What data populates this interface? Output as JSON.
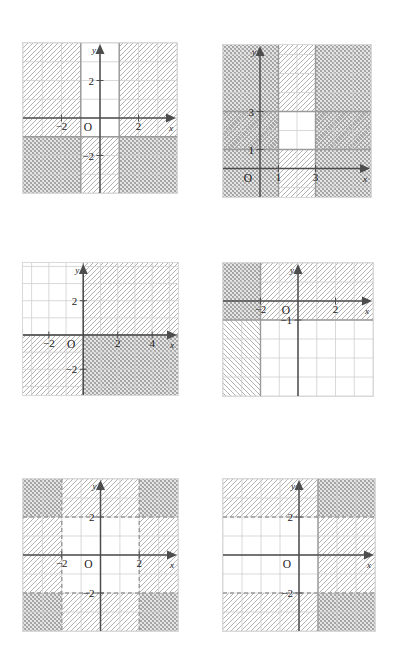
{
  "page": {
    "kind": "math-worksheet-answer-key",
    "background": "#ffffff",
    "columns": 2,
    "rows": 3
  },
  "style": {
    "grid_minor_color": "#cfcfcf",
    "grid_major_color": "#9a9a9a",
    "axis_color": "#4d4d4d",
    "hatch_a_color": "#a8a8a8",
    "hatch_b_color": "#9c9c9c",
    "plot_border_color": "#d9d9d9",
    "label_color": "#333333",
    "number_color": "#1b1b1b"
  },
  "axis_labels": {
    "x": "x",
    "y": "y",
    "origin": "O"
  },
  "problems": [
    {
      "number": "12",
      "underlined": false,
      "position": {
        "x": 24,
        "y": 18
      },
      "plot": {
        "x": 22,
        "y": 42,
        "w": 154,
        "h": 150
      },
      "view": {
        "xmin": -4,
        "xmax": 4,
        "ymin": -4,
        "ymax": 4
      },
      "axis_ticks": {
        "x": [
          -2,
          2
        ],
        "y": [
          2,
          -2
        ]
      },
      "boundaries": [
        {
          "type": "vertical",
          "value": -1,
          "style": "solid"
        },
        {
          "type": "vertical",
          "value": 1,
          "style": "solid"
        },
        {
          "type": "horizontal",
          "value": -1,
          "style": "solid"
        }
      ],
      "regions": [
        {
          "label": "x <= -1",
          "hatch": "forward",
          "rect": [
            -4,
            -1,
            -1,
            4
          ]
        },
        {
          "label": "x >= 1",
          "hatch": "forward",
          "rect": [
            1,
            -1,
            4,
            4
          ]
        },
        {
          "label": "y <= -1 left",
          "hatch": "cross",
          "rect": [
            -4,
            -4,
            -1,
            -1
          ]
        },
        {
          "label": "y <= -1 middle",
          "hatch": "forward",
          "rect": [
            -1,
            -4,
            1,
            -1
          ]
        },
        {
          "label": "y <= -1 right",
          "hatch": "cross",
          "rect": [
            1,
            -4,
            4,
            -1
          ]
        }
      ],
      "solution_white": [
        [
          -1,
          -1,
          1,
          4
        ]
      ]
    },
    {
      "number": "15",
      "underlined": true,
      "position": {
        "x": 221,
        "y": 18
      },
      "plot": {
        "x": 222,
        "y": 44,
        "w": 148,
        "h": 152
      },
      "view": {
        "xmin": -2,
        "xmax": 6,
        "ymin": -1.5,
        "ymax": 6.5
      },
      "axis_ticks": {
        "x": [
          1,
          3
        ],
        "y": [
          1,
          3
        ]
      },
      "boundaries": [
        {
          "type": "vertical",
          "value": 1,
          "style": "solid"
        },
        {
          "type": "vertical",
          "value": 3,
          "style": "solid"
        },
        {
          "type": "horizontal",
          "value": 1,
          "style": "solid"
        },
        {
          "type": "horizontal",
          "value": 3,
          "style": "solid"
        }
      ],
      "regions": [
        {
          "label": "outside x band",
          "hatch": "cross",
          "rect": [
            -2,
            -1.5,
            1,
            6.5
          ]
        },
        {
          "label": "outside x band right",
          "hatch": "cross",
          "rect": [
            3,
            -1.5,
            6,
            6.5
          ]
        },
        {
          "label": "inside x band below",
          "hatch": "forward",
          "rect": [
            1,
            -1.5,
            3,
            1
          ]
        },
        {
          "label": "inside x band above",
          "hatch": "forward",
          "rect": [
            1,
            3,
            3,
            6.5
          ]
        },
        {
          "label": "y band left",
          "hatch": "forward",
          "rect": [
            -2,
            1,
            1,
            3
          ]
        },
        {
          "label": "y band right",
          "hatch": "forward",
          "rect": [
            3,
            1,
            6,
            3
          ]
        }
      ],
      "solution_white": [
        [
          1,
          1,
          3,
          3
        ]
      ]
    },
    {
      "number": "13",
      "underlined": false,
      "position": {
        "x": 24,
        "y": 238
      },
      "plot": {
        "x": 22,
        "y": 262,
        "w": 155,
        "h": 132
      },
      "view": {
        "xmin": -3.5,
        "xmax": 5.5,
        "ymin": -3.5,
        "ymax": 4.2
      },
      "axis_ticks": {
        "x": [
          -2,
          2,
          4
        ],
        "y": [
          2,
          -2
        ]
      },
      "boundaries": [
        {
          "type": "vertical",
          "value": 0,
          "style": "solid"
        },
        {
          "type": "horizontal",
          "value": 0,
          "style": "solid"
        }
      ],
      "regions": [
        {
          "label": "quadrant I",
          "hatch": "forward",
          "rect": [
            0,
            0,
            5.5,
            4.2
          ]
        },
        {
          "label": "quadrant III",
          "hatch": "forward",
          "rect": [
            -3.5,
            -3.5,
            0,
            0
          ]
        },
        {
          "label": "quadrant IV",
          "hatch": "cross",
          "rect": [
            0,
            -3.5,
            5.5,
            0
          ]
        }
      ],
      "solution_white": [
        [
          -3.5,
          0,
          0,
          4.2
        ]
      ]
    },
    {
      "number": "16",
      "underlined": true,
      "position": {
        "x": 221,
        "y": 238
      },
      "plot": {
        "x": 222,
        "y": 262,
        "w": 150,
        "h": 133
      },
      "view": {
        "xmin": -4,
        "xmax": 4,
        "ymin": -5,
        "ymax": 2
      },
      "axis_ticks": {
        "x": [
          -2,
          2
        ],
        "y": [
          -1
        ]
      },
      "boundaries": [
        {
          "type": "vertical",
          "value": -2,
          "style": "solid"
        },
        {
          "type": "horizontal",
          "value": -1,
          "style": "solid"
        }
      ],
      "regions": [
        {
          "label": "x <= -2 and y >= -1",
          "hatch": "cross",
          "rect": [
            -4,
            -1,
            -2,
            2
          ]
        },
        {
          "label": "x <= -2 and y <= -1",
          "hatch": "backward",
          "rect": [
            -4,
            -5,
            -2,
            -1
          ]
        },
        {
          "label": "y >= -1 right of -2",
          "hatch": "forward",
          "rect": [
            -2,
            -1,
            4,
            2
          ]
        }
      ],
      "solution_white": [
        [
          -2,
          -5,
          4,
          -1
        ]
      ]
    },
    {
      "number": "14",
      "underlined": false,
      "position": {
        "x": 24,
        "y": 452
      },
      "plot": {
        "x": 22,
        "y": 478,
        "w": 155,
        "h": 152
      },
      "view": {
        "xmin": -4,
        "xmax": 4,
        "ymin": -4,
        "ymax": 4
      },
      "axis_ticks": {
        "x": [
          -2,
          2
        ],
        "y": [
          2,
          -2
        ]
      },
      "boundaries": [
        {
          "type": "vertical",
          "value": -2,
          "style": "dashed"
        },
        {
          "type": "vertical",
          "value": 2,
          "style": "dashed"
        },
        {
          "type": "horizontal",
          "value": 2,
          "style": "dashed"
        },
        {
          "type": "horizontal",
          "value": -2,
          "style": "dashed"
        }
      ],
      "regions": [
        {
          "label": "x<=-2 band",
          "hatch": "forward",
          "rect": [
            -4,
            -2,
            -2,
            2
          ]
        },
        {
          "label": "x>=2 band",
          "hatch": "forward",
          "rect": [
            2,
            -2,
            4,
            2
          ]
        },
        {
          "label": "y>=2 band",
          "hatch": "forward",
          "rect": [
            -2,
            2,
            2,
            4
          ]
        },
        {
          "label": "y<=-2 band",
          "hatch": "forward",
          "rect": [
            -2,
            -4,
            2,
            -2
          ]
        },
        {
          "label": "corner top-left",
          "hatch": "cross",
          "rect": [
            -4,
            2,
            -2,
            4
          ]
        },
        {
          "label": "corner top-right",
          "hatch": "cross",
          "rect": [
            2,
            2,
            4,
            4
          ]
        },
        {
          "label": "corner bottom-left",
          "hatch": "cross",
          "rect": [
            -4,
            -4,
            -2,
            -2
          ]
        },
        {
          "label": "corner bottom-right",
          "hatch": "cross",
          "rect": [
            2,
            -4,
            4,
            -2
          ]
        }
      ],
      "solution_white": [
        [
          -2,
          -2,
          2,
          2
        ]
      ]
    },
    {
      "number": "17",
      "underlined": true,
      "position": {
        "x": 221,
        "y": 452
      },
      "plot": {
        "x": 222,
        "y": 478,
        "w": 152,
        "h": 152
      },
      "view": {
        "xmin": -4,
        "xmax": 4,
        "ymin": -4,
        "ymax": 4
      },
      "axis_ticks": {
        "x": [],
        "y": [
          2,
          -2
        ]
      },
      "boundaries": [
        {
          "type": "vertical",
          "value": 1,
          "style": "solid"
        },
        {
          "type": "horizontal",
          "value": 2,
          "style": "dashed"
        },
        {
          "type": "horizontal",
          "value": -2,
          "style": "dashed"
        }
      ],
      "regions": [
        {
          "label": "y>=2 left",
          "hatch": "forward",
          "rect": [
            -4,
            2,
            1,
            4
          ]
        },
        {
          "label": "y<=-2 left",
          "hatch": "forward",
          "rect": [
            -4,
            -4,
            1,
            -2
          ]
        },
        {
          "label": "x>=1 middle",
          "hatch": "forward",
          "rect": [
            1,
            -2,
            4,
            2
          ]
        },
        {
          "label": "x>=1 and y>=2",
          "hatch": "cross",
          "rect": [
            1,
            2,
            4,
            4
          ]
        },
        {
          "label": "x>=1 and y<=-2",
          "hatch": "cross",
          "rect": [
            1,
            -4,
            4,
            -2
          ]
        }
      ],
      "solution_white": [
        [
          -4,
          -2,
          1,
          2
        ]
      ]
    }
  ]
}
